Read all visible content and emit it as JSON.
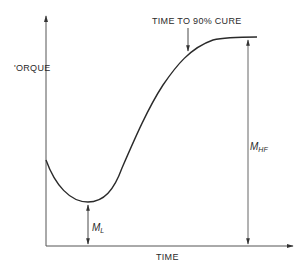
{
  "diagram": {
    "type": "cure-curve",
    "y_axis_label": "'ORQUE",
    "x_axis_label": "TIME",
    "annotation_top": "TIME TO 90% CURE",
    "min_label_main": "M",
    "min_label_sub": "L",
    "max_label_main": "M",
    "max_label_sub": "HF",
    "line_color": "#2a2a2a",
    "axis_color": "#555555"
  }
}
